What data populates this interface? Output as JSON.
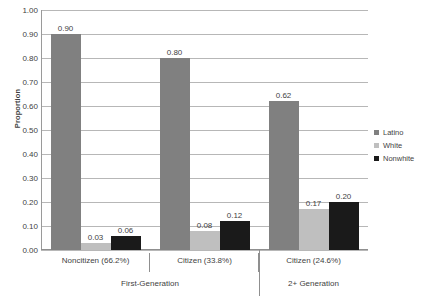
{
  "chart_data": {
    "type": "bar",
    "title": "",
    "xlabel": "",
    "ylabel": "Proportion",
    "ylim": [
      0,
      1.0
    ],
    "ytick_step": 0.1,
    "grid": true,
    "legend_position": "right",
    "categories": [
      "Noncitizen (66.2%)",
      "Citizen (33.8%)",
      "Citizen (24.6%)"
    ],
    "group_labels": [
      "First-Generation",
      "2+ Generation"
    ],
    "series": [
      {
        "name": "Latino",
        "color": "#808080",
        "values": [
          0.9,
          0.8,
          0.62
        ]
      },
      {
        "name": "White",
        "color": "#bfbfbf",
        "values": [
          0.03,
          0.08,
          0.17
        ]
      },
      {
        "name": "Nonwhite",
        "color": "#1a1a1a",
        "values": [
          0.06,
          0.12,
          0.2
        ]
      }
    ],
    "value_labels": [
      [
        "0.90",
        "0.03",
        "0.06"
      ],
      [
        "0.80",
        "0.08",
        "0.12"
      ],
      [
        "0.62",
        "0.17",
        "0.20"
      ]
    ],
    "ytick_labels": [
      "0.00",
      "0.10",
      "0.20",
      "0.30",
      "0.40",
      "0.50",
      "0.60",
      "0.70",
      "0.80",
      "0.90",
      "1.00"
    ]
  },
  "axis": {
    "y_title": "Proportion"
  },
  "legend": {
    "items": [
      {
        "label": "Latino"
      },
      {
        "label": "White"
      },
      {
        "label": "Nonwhite"
      }
    ]
  }
}
